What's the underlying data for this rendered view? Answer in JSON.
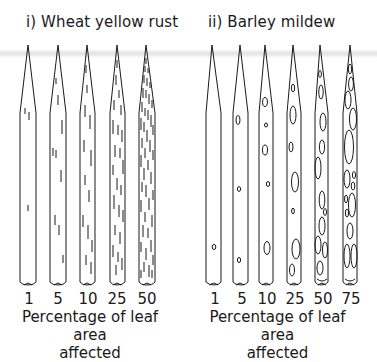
{
  "panels": [
    {
      "title": "i) Wheat yellow rust",
      "levels": [
        "1",
        "5",
        "10",
        "25",
        "50"
      ],
      "xlabel_line1": "Percentage of leaf area",
      "xlabel_line2": "affected",
      "symptom": "stripes"
    },
    {
      "title": "ii) Barley mildew",
      "levels": [
        "1",
        "5",
        "10",
        "25",
        "50",
        "75"
      ],
      "xlabel_line1": "Percentage of leaf area",
      "xlabel_line2": "affected",
      "symptom": "ovals"
    }
  ],
  "colors": {
    "ink": "#1a1a1a",
    "background": "#ffffff",
    "band": "#e6e6e6"
  }
}
